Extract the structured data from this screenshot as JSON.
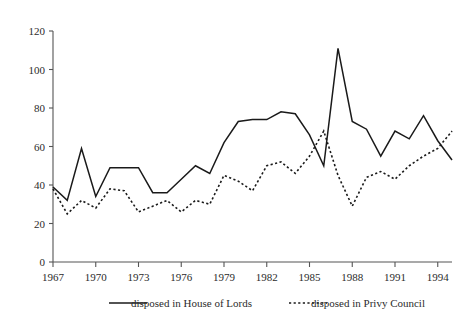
{
  "chart_data": {
    "type": "line",
    "title": "",
    "subtitle": "",
    "xlabel": "",
    "ylabel": "",
    "xlim": [
      1967,
      1995
    ],
    "ylim": [
      0,
      120
    ],
    "grid": false,
    "legend_position": "bottom",
    "y_ticks": [
      0,
      20,
      40,
      60,
      80,
      100,
      120
    ],
    "y_tick_labels": [
      "0",
      "20",
      "40",
      "60",
      "80",
      "100",
      "120"
    ],
    "x_ticks": [
      1967,
      1970,
      1973,
      1976,
      1979,
      1982,
      1985,
      1988,
      1991,
      1994
    ],
    "x_tick_labels": [
      "1967",
      "1970",
      "1973",
      "1976",
      "1979",
      "1982",
      "1985",
      "1988",
      "1991",
      "1994"
    ],
    "x": [
      1967,
      1968,
      1969,
      1970,
      1971,
      1972,
      1973,
      1974,
      1975,
      1976,
      1977,
      1978,
      1979,
      1980,
      1981,
      1982,
      1983,
      1984,
      1985,
      1986,
      1987,
      1988,
      1989,
      1990,
      1991,
      1992,
      1993,
      1994,
      1995
    ],
    "series": [
      {
        "name": "disposed in House of Lords",
        "style": "solid",
        "color": "#1a1a1a",
        "values": [
          39,
          32,
          59,
          34,
          49,
          49,
          49,
          36,
          36,
          43,
          50,
          46,
          62,
          73,
          74,
          74,
          78,
          77,
          66,
          50,
          111,
          73,
          69,
          55,
          68,
          64,
          76,
          63,
          53
        ]
      },
      {
        "name": "disposed in Privy Council",
        "style": "dotted",
        "color": "#1a1a1a",
        "values": [
          38,
          25,
          32,
          28,
          38,
          37,
          26,
          29,
          32,
          26,
          32,
          30,
          45,
          42,
          37,
          50,
          52,
          46,
          55,
          68,
          45,
          29,
          44,
          47,
          43,
          50,
          55,
          59,
          68
        ]
      }
    ],
    "legend": [
      {
        "label": "disposed in House of Lords",
        "style": "solid"
      },
      {
        "label": "disposed in Privy Council",
        "style": "dotted"
      }
    ]
  }
}
